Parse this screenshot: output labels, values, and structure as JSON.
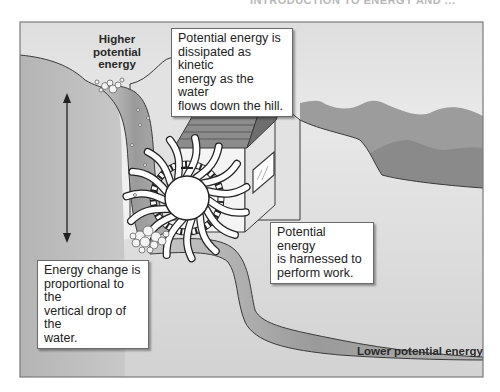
{
  "header": {
    "running_head": "INTRODUCTION TO ENERGY AND ..."
  },
  "diagram": {
    "colors": {
      "frame_border": "#7a7a7a",
      "sky": "#ececec",
      "hill": "#bdbdbd",
      "far_mountains": "#9a9a9a",
      "near_mountains": "#8c8c8c",
      "stream": "#a6a6a6",
      "roof": "#8a8a8a",
      "wall": "#f0f0f0",
      "ground": "#dcdcdc"
    },
    "labels": {
      "higher": [
        "Higher",
        "potential",
        "energy"
      ],
      "lower": "Lower potential energy"
    },
    "callouts": {
      "dissipated": [
        "Potential energy is",
        "dissipated as kinetic",
        "energy as the water",
        "flows down the hill."
      ],
      "harnessed": [
        "Potential energy",
        "is harnessed to",
        "perform work."
      ],
      "energy_change": [
        "Energy change is",
        "proportional to the",
        "vertical drop of the",
        "water."
      ]
    },
    "elements": {
      "arrow": "double-headed-vertical-arrow",
      "wheel": "waterwheel",
      "house": "mill-house",
      "bubbles": "water-splash"
    }
  }
}
